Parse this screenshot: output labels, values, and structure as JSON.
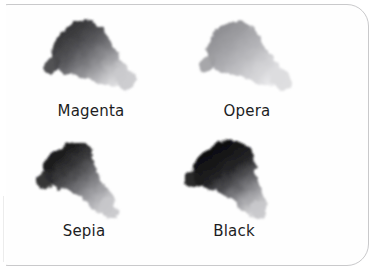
{
  "card": {
    "name": "ink-swatch-card",
    "background_color": "#fefefe",
    "border_color": "#c9c9cb",
    "corner_radius_px": 22
  },
  "grid": {
    "columns": 2,
    "rows": 2
  },
  "swatches": [
    {
      "id": "magenta",
      "label": "Magenta",
      "tone": "medium-dark",
      "dark_color": "#3a3a3c",
      "mid_color": "#6e6e72",
      "light_color": "#d8d8da"
    },
    {
      "id": "opera",
      "label": "Opera",
      "tone": "light",
      "dark_color": "#8d8d91",
      "mid_color": "#b4b4b8",
      "light_color": "#e6e6e8"
    },
    {
      "id": "sepia",
      "label": "Sepia",
      "tone": "dark",
      "dark_color": "#1f1f20",
      "mid_color": "#737375",
      "light_color": "#d2d2d4"
    },
    {
      "id": "black",
      "label": "Black",
      "tone": "darkest",
      "dark_color": "#121213",
      "mid_color": "#5a5a5c",
      "light_color": "#d5d5d7"
    }
  ]
}
